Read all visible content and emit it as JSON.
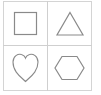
{
  "grid": {
    "rows": 2,
    "cols": 2,
    "cells": [
      {
        "shape": "square",
        "icon": "square-icon"
      },
      {
        "shape": "triangle",
        "icon": "triangle-icon"
      },
      {
        "shape": "heart",
        "icon": "heart-icon"
      },
      {
        "shape": "hexagon",
        "icon": "hexagon-icon"
      }
    ]
  },
  "colors": {
    "stroke": "#8a8a8a",
    "grid_line": "#cfcfcf",
    "background": "#ffffff"
  }
}
